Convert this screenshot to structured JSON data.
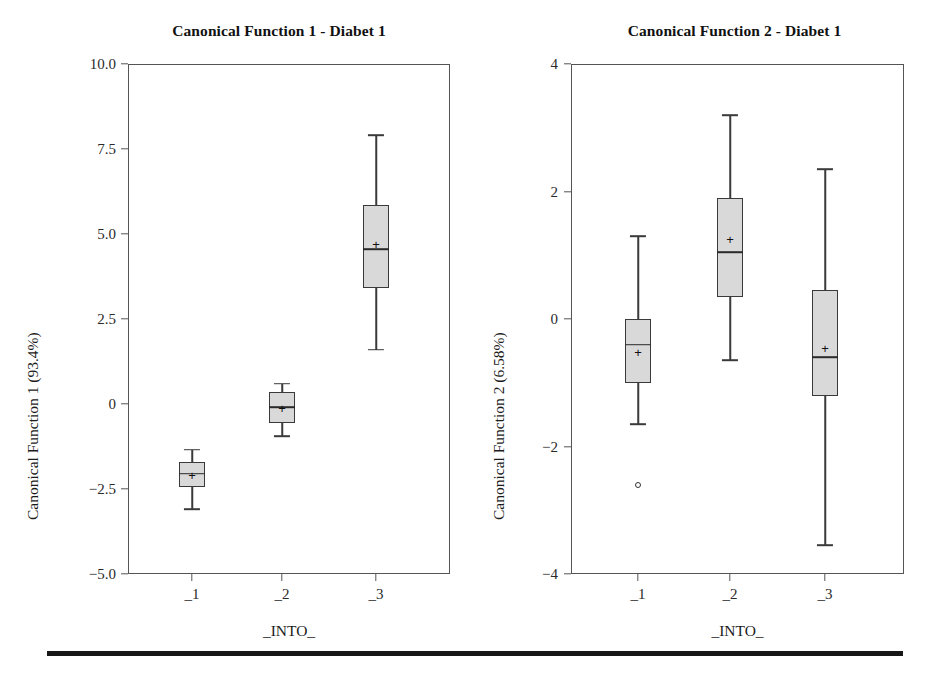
{
  "figure": {
    "bottom_rule_color": "#171717",
    "box_fill_color": "#d9d9d9",
    "line_color": "#3a3a3a"
  },
  "panels": [
    {
      "id": "panel-left",
      "title": "Canonical Function 1 - Diabet 1",
      "ylabel": "Canonical Function 1 (93.4%)",
      "xlabel": "_INTO_",
      "yticks": [
        "10.0",
        "7.5",
        "5.0",
        "2.5",
        "0",
        "−2.5",
        "−5.0"
      ],
      "xticks": [
        "_1",
        "_2",
        "_3"
      ]
    },
    {
      "id": "panel-right",
      "title": "Canonical Function 2 - Diabet 1",
      "ylabel": "Canonical Function 2 (6.58%)",
      "xlabel": "_INTO_",
      "yticks": [
        "4",
        "2",
        "0",
        "−2",
        "−4"
      ],
      "xticks": [
        "_1",
        "_2",
        "_3"
      ]
    }
  ],
  "chart_data": [
    {
      "type": "boxplot",
      "panel": "left",
      "title": "Canonical Function 1 - Diabet 1",
      "xlabel": "_INTO_",
      "ylabel": "Canonical Function 1 (93.4%)",
      "categories": [
        "_1",
        "_2",
        "_3"
      ],
      "ylim": [
        -5.0,
        10.0
      ],
      "ytick_values": [
        10.0,
        7.5,
        5.0,
        2.5,
        0,
        -2.5,
        -5.0
      ],
      "grid": false,
      "legend": "none",
      "boxes": [
        {
          "category": "_1",
          "whisker_low": -3.1,
          "q1": -2.45,
          "median": -2.05,
          "mean": -2.1,
          "q3": -1.7,
          "whisker_high": -1.35,
          "outliers": []
        },
        {
          "category": "_2",
          "whisker_low": -0.95,
          "q1": -0.55,
          "median": -0.1,
          "mean": -0.12,
          "q3": 0.35,
          "whisker_high": 0.6,
          "outliers": []
        },
        {
          "category": "_3",
          "whisker_low": 1.6,
          "q1": 3.4,
          "median": 4.55,
          "mean": 4.72,
          "q3": 5.85,
          "whisker_high": 7.9,
          "outliers": []
        }
      ]
    },
    {
      "type": "boxplot",
      "panel": "right",
      "title": "Canonical Function 2 - Diabet 1",
      "xlabel": "_INTO_",
      "ylabel": "Canonical Function 2 (6.58%)",
      "categories": [
        "_1",
        "_2",
        "_3"
      ],
      "ylim": [
        -4.0,
        4.0
      ],
      "ytick_values": [
        4,
        2,
        0,
        -2,
        -4
      ],
      "grid": false,
      "legend": "none",
      "boxes": [
        {
          "category": "_1",
          "whisker_low": -1.65,
          "q1": -1.0,
          "median": -0.4,
          "mean": -0.52,
          "q3": 0.0,
          "whisker_high": 1.3,
          "outliers": [
            -2.6
          ]
        },
        {
          "category": "_2",
          "whisker_low": -0.65,
          "q1": 0.35,
          "median": 1.05,
          "mean": 1.25,
          "q3": 1.9,
          "whisker_high": 3.2,
          "outliers": []
        },
        {
          "category": "_3",
          "whisker_low": -3.55,
          "q1": -1.2,
          "median": -0.6,
          "mean": -0.45,
          "q3": 0.45,
          "whisker_high": 2.35,
          "outliers": []
        }
      ]
    }
  ]
}
